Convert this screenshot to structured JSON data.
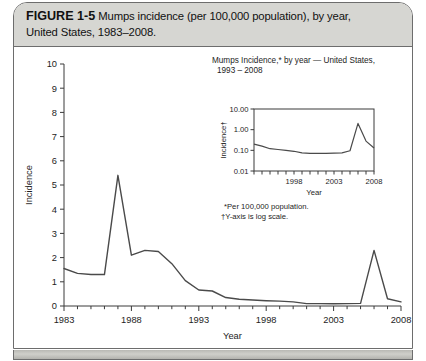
{
  "figure": {
    "label": "FIGURE 1-5",
    "caption": "Mumps incidence (per 100,000 population), by year, United States, 1983–2008.",
    "caption_line1": "Mumps incidence (per 100,000 population), by year,",
    "caption_line2": "United States, 1983–2008."
  },
  "chart_data": [
    {
      "type": "line",
      "id": "main-chart",
      "title": "",
      "xlabel": "Year",
      "ylabel": "Incidence",
      "xlim": [
        1983,
        2008
      ],
      "ylim": [
        0,
        10
      ],
      "ytick_labels": [
        "0",
        "1",
        "2",
        "3",
        "4",
        "5",
        "6",
        "7",
        "8",
        "9",
        "10"
      ],
      "ytick_values": [
        0,
        1,
        2,
        3,
        4,
        5,
        6,
        7,
        8,
        9,
        10
      ],
      "xtick_labels": [
        "1983",
        "1988",
        "1993",
        "1998",
        "2003",
        "2008"
      ],
      "xtick_values": [
        1983,
        1988,
        1993,
        1998,
        2003,
        2008
      ],
      "grid": false,
      "legend": "none",
      "x": [
        1983,
        1984,
        1985,
        1986,
        1987,
        1988,
        1989,
        1990,
        1991,
        1992,
        1993,
        1994,
        1995,
        1996,
        1997,
        1998,
        1999,
        2000,
        2001,
        2002,
        2003,
        2004,
        2005,
        2006,
        2007,
        2008
      ],
      "values": [
        1.55,
        1.35,
        1.3,
        1.3,
        5.4,
        2.1,
        2.3,
        2.25,
        1.75,
        1.05,
        0.66,
        0.62,
        0.35,
        0.28,
        0.25,
        0.22,
        0.2,
        0.17,
        0.1,
        0.1,
        0.09,
        0.1,
        0.11,
        2.3,
        0.3,
        0.17
      ]
    },
    {
      "type": "line",
      "id": "inset-chart",
      "title_line1": "Mumps Incidence,* by year — United States,",
      "title_line2": "1993 – 2008",
      "xlabel": "Year",
      "ylabel": "Incidence†",
      "yscale": "log",
      "ylim": [
        0.01,
        10.0
      ],
      "ytick_labels": [
        "0.01",
        "0.10",
        "1.00",
        "10.00"
      ],
      "ytick_values": [
        0.01,
        0.1,
        1.0,
        10.0
      ],
      "xlim": [
        1993,
        2008
      ],
      "xtick_labels": [
        "1998",
        "2003",
        "2008"
      ],
      "xtick_values": [
        1998,
        2003,
        2008
      ],
      "grid": false,
      "legend": "none",
      "x": [
        1993,
        1994,
        1995,
        1996,
        1997,
        1998,
        1999,
        2000,
        2001,
        2002,
        2003,
        2004,
        2005,
        2006,
        2007,
        2008
      ],
      "values": [
        0.2,
        0.16,
        0.12,
        0.11,
        0.1,
        0.09,
        0.075,
        0.072,
        0.072,
        0.072,
        0.073,
        0.075,
        0.095,
        2.0,
        0.28,
        0.13
      ],
      "footnote1": "*Per 100,000 population.",
      "footnote2": "†Y-axis is log scale."
    }
  ]
}
